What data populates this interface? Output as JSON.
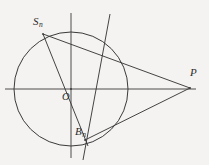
{
  "figure": {
    "background_color": "#f4f3f1",
    "stroke_color": "#3a3a3a",
    "label_color": "#2b2b2b",
    "width": 209,
    "height": 165
  },
  "labels": {
    "s_n": "S",
    "s_n_sub": "n",
    "o": "O",
    "b_n": "B",
    "b_n_sub": "n",
    "p": "P"
  },
  "chart_data": {
    "type": "diagram",
    "xlabel": "",
    "ylabel": "",
    "coordinate_system": "pixel",
    "circle": {
      "name": "main-circle",
      "center_x": 71,
      "center_y": 89,
      "radius": 57
    },
    "axes": [
      {
        "name": "horizontal-axis",
        "x1": 5,
        "y1": 89,
        "x2": 196,
        "y2": 89
      },
      {
        "name": "vertical-axis",
        "x1": 71,
        "y1": 13,
        "x2": 71,
        "y2": 158
      }
    ],
    "points": [
      {
        "name": "S_n",
        "label": "Sₙ",
        "x": 43,
        "y": 34,
        "on_circle": true
      },
      {
        "name": "O",
        "label": "O",
        "x": 71,
        "y": 89,
        "on_circle": false
      },
      {
        "name": "B_n",
        "label": "Bₙ",
        "x": 85,
        "y": 140,
        "on_circle": true
      },
      {
        "name": "P",
        "label": "P",
        "x": 190,
        "y": 88,
        "on_circle": false
      }
    ],
    "segments": [
      {
        "name": "secant-Sn-P",
        "x1": 43,
        "y1": 34,
        "x2": 190,
        "y2": 88
      },
      {
        "name": "secant-Bn-P",
        "x1": 85,
        "y1": 140,
        "x2": 190,
        "y2": 88
      },
      {
        "name": "diameter-Sn-Bn",
        "x1": 43,
        "y1": 34,
        "x2": 88,
        "y2": 146
      },
      {
        "name": "oblique-chord",
        "x1": 110,
        "y1": 14,
        "x2": 83,
        "y2": 160
      }
    ]
  }
}
